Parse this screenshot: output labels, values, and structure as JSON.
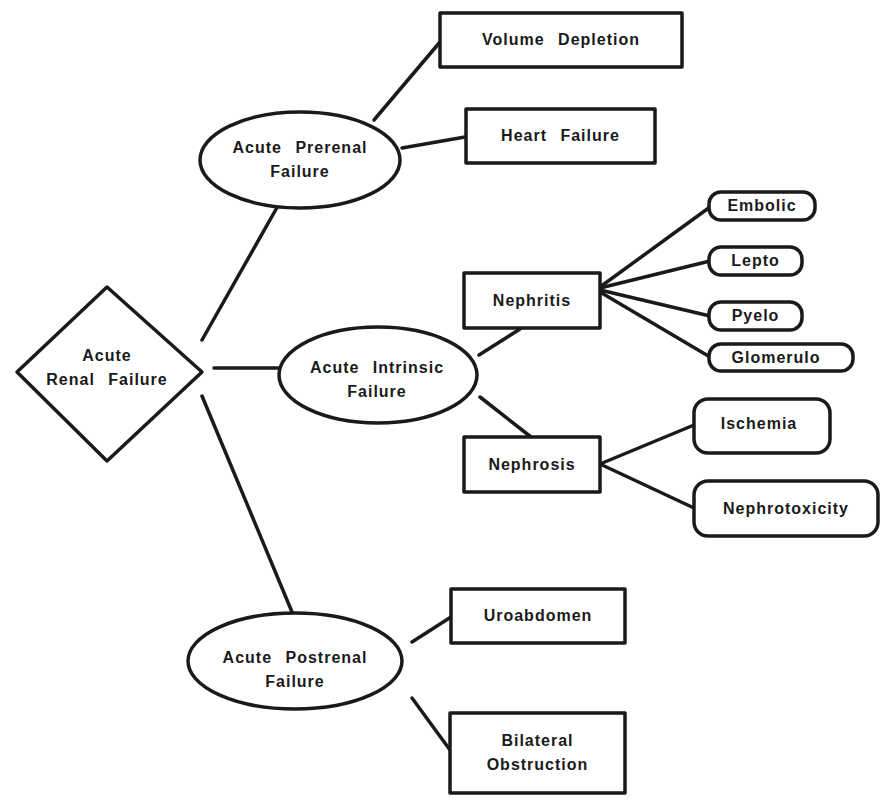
{
  "diagram": {
    "type": "tree",
    "title": "",
    "colors": {
      "line": "#1a1a1a",
      "fill": "#ffffff",
      "text": "#1a1a1a"
    },
    "root": {
      "shape": "diamond",
      "line1": "Acute",
      "line2": "Renal  Failure"
    },
    "prerenal": {
      "shape": "ellipse",
      "line1": "Acute  Prerenal",
      "line2": "Failure",
      "children": [
        {
          "shape": "rect",
          "label": "Volume  Depletion"
        },
        {
          "shape": "rect",
          "label": "Heart  Failure"
        }
      ]
    },
    "intrinsic": {
      "shape": "ellipse",
      "line1": "Acute  Intrinsic",
      "line2": "Failure",
      "nephritis": {
        "shape": "rect",
        "label": "Nephritis",
        "children": [
          {
            "shape": "pill",
            "label": "Embolic"
          },
          {
            "shape": "pill",
            "label": "Lepto"
          },
          {
            "shape": "pill",
            "label": "Pyelo"
          },
          {
            "shape": "pill",
            "label": "Glomerulo"
          }
        ]
      },
      "nephrosis": {
        "shape": "rect",
        "label": "Nephrosis",
        "children": [
          {
            "shape": "rounded-rect",
            "label": "Ischemia"
          },
          {
            "shape": "rounded-rect",
            "label": "Nephrotoxicity"
          }
        ]
      }
    },
    "postrenal": {
      "shape": "ellipse",
      "line1": "Acute  Postrenal",
      "line2": "Failure",
      "children": [
        {
          "shape": "rect",
          "label": "Uroabdomen"
        },
        {
          "shape": "rect",
          "line1": "Bilateral",
          "line2": "Obstruction"
        }
      ]
    }
  }
}
